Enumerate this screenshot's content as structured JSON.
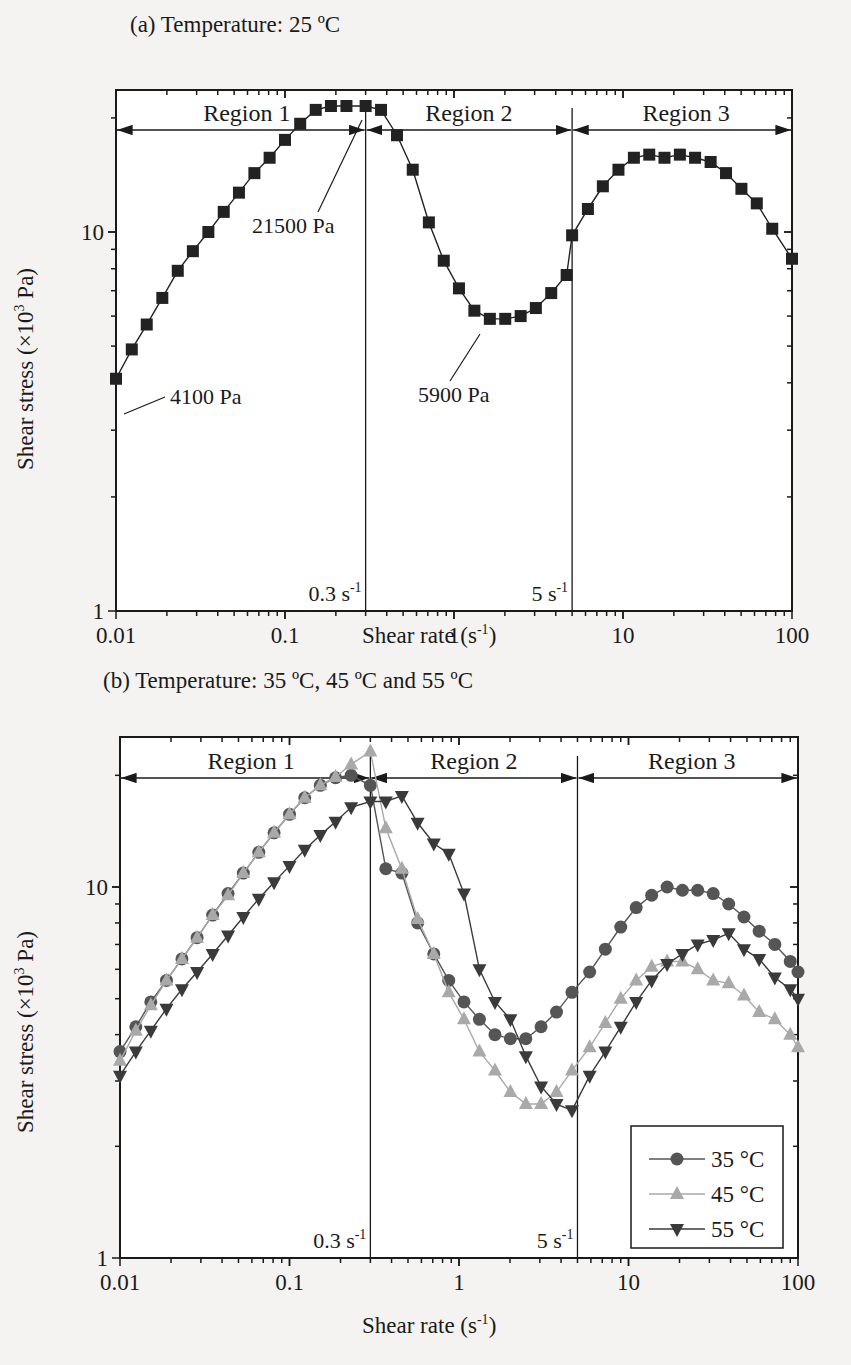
{
  "chart_data": [
    {
      "type": "line",
      "title": "(a) Temperature: 25 ºC",
      "xlabel": "Shear rate (s-1)",
      "ylabel": "Shear stress (×103 Pa)",
      "xscale": "log",
      "yscale": "log",
      "xlim": [
        0.01,
        100
      ],
      "ylim": [
        1,
        24
      ],
      "xticks": [
        "0.01",
        "0.1",
        "1",
        "10",
        "100"
      ],
      "yticks": [
        "1",
        "10"
      ],
      "grid": false,
      "regions": [
        {
          "label": "Region 1",
          "from": 0.01,
          "to": 0.3
        },
        {
          "label": "Region 2",
          "from": 0.3,
          "to": 5
        },
        {
          "label": "Region 3",
          "from": 5,
          "to": 100
        }
      ],
      "boundaries": [
        {
          "x": 0.3,
          "label": "0.3 s-1"
        },
        {
          "x": 5,
          "label": "5 s-1"
        }
      ],
      "annotations": [
        {
          "text": "4100 Pa",
          "x": 0.01,
          "y": 4.1
        },
        {
          "text": "21500 Pa",
          "x": 0.3,
          "y": 21.5
        },
        {
          "text": "5900 Pa",
          "x": 1.5,
          "y": 5.9
        }
      ],
      "series": [
        {
          "name": "25 °C",
          "marker": "square",
          "color": "#222222",
          "x": [
            0.01,
            0.0124,
            0.0152,
            0.0188,
            0.0232,
            0.0285,
            0.0352,
            0.0434,
            0.0534,
            0.0659,
            0.0811,
            0.1,
            0.123,
            0.152,
            0.187,
            0.231,
            0.3,
            0.37,
            0.46,
            0.57,
            0.71,
            0.87,
            1.07,
            1.32,
            1.63,
            2.01,
            2.48,
            3.05,
            3.76,
            4.64,
            5.0,
            6.2,
            7.6,
            9.4,
            11.6,
            14.3,
            17.6,
            21.7,
            26.7,
            33,
            40.7,
            50.2,
            61.9,
            76.4,
            100
          ],
          "y": [
            4.1,
            4.9,
            5.7,
            6.7,
            7.9,
            8.9,
            10.0,
            11.3,
            12.7,
            14.3,
            15.7,
            17.5,
            19.3,
            21.0,
            21.5,
            21.5,
            21.5,
            21.0,
            18.0,
            14.6,
            10.6,
            8.4,
            7.1,
            6.2,
            5.9,
            5.9,
            6.0,
            6.3,
            6.9,
            7.7,
            9.8,
            11.5,
            13.2,
            14.6,
            15.7,
            16.0,
            15.7,
            16.0,
            15.7,
            15.3,
            14.3,
            13.0,
            11.9,
            10.2,
            8.5
          ]
        }
      ]
    },
    {
      "type": "line",
      "title": "(b) Temperature: 35 ºC, 45 ºC and 55 ºC",
      "xlabel": "Shear rate (s-1)",
      "ylabel": "Shear stress (×103 Pa)",
      "xscale": "log",
      "yscale": "log",
      "xlim": [
        0.01,
        100
      ],
      "ylim": [
        1,
        24
      ],
      "xticks": [
        "0.01",
        "0.1",
        "1",
        "10",
        "100"
      ],
      "yticks": [
        "1",
        "10"
      ],
      "grid": false,
      "legend_position": "lower right",
      "regions": [
        {
          "label": "Region 1",
          "from": 0.01,
          "to": 0.3
        },
        {
          "label": "Region 2",
          "from": 0.3,
          "to": 5
        },
        {
          "label": "Region 3",
          "from": 5,
          "to": 100
        }
      ],
      "boundaries": [
        {
          "x": 0.3,
          "label": "0.3 s-1"
        },
        {
          "x": 5,
          "label": "5 s-1"
        }
      ],
      "series": [
        {
          "name": "35 °C",
          "marker": "circle",
          "color": "#555555",
          "x": [
            0.01,
            0.0124,
            0.0152,
            0.0188,
            0.0232,
            0.0285,
            0.0352,
            0.0434,
            0.0534,
            0.0659,
            0.0811,
            0.1,
            0.123,
            0.152,
            0.187,
            0.231,
            0.3,
            0.37,
            0.46,
            0.57,
            0.71,
            0.87,
            1.07,
            1.32,
            1.63,
            2.01,
            2.48,
            3.05,
            3.76,
            4.64,
            5.9,
            7.3,
            9.0,
            11.1,
            13.7,
            16.9,
            20.8,
            25.6,
            31.6,
            39,
            48,
            59,
            73,
            90,
            100
          ],
          "y": [
            3.6,
            4.2,
            4.9,
            5.6,
            6.4,
            7.3,
            8.4,
            9.6,
            10.9,
            12.4,
            14.0,
            15.7,
            17.4,
            18.8,
            19.7,
            20.0,
            18.8,
            11.2,
            10.9,
            8.0,
            6.6,
            5.6,
            4.9,
            4.4,
            4.0,
            3.9,
            3.9,
            4.2,
            4.6,
            5.2,
            5.9,
            6.8,
            7.8,
            8.8,
            9.5,
            10.0,
            9.8,
            9.8,
            9.6,
            9.0,
            8.3,
            7.6,
            7.0,
            6.3,
            5.9
          ]
        },
        {
          "name": "45 °C",
          "marker": "triangle-up",
          "color": "#a9a9a9",
          "x": [
            0.01,
            0.0124,
            0.0152,
            0.0188,
            0.0232,
            0.0285,
            0.0352,
            0.0434,
            0.0534,
            0.0659,
            0.0811,
            0.1,
            0.123,
            0.152,
            0.187,
            0.231,
            0.3,
            0.37,
            0.46,
            0.57,
            0.71,
            0.87,
            1.07,
            1.32,
            1.63,
            2.01,
            2.48,
            3.05,
            3.76,
            4.64,
            5.9,
            7.3,
            9.0,
            11.1,
            13.7,
            16.9,
            20.8,
            25.6,
            31.6,
            39,
            48,
            59,
            73,
            90,
            100
          ],
          "y": [
            3.4,
            4.1,
            4.8,
            5.6,
            6.4,
            7.3,
            8.4,
            9.5,
            10.9,
            12.4,
            14.0,
            15.7,
            17.4,
            18.8,
            19.8,
            21.4,
            23.2,
            14.4,
            11.2,
            8.2,
            6.6,
            5.2,
            4.4,
            3.6,
            3.2,
            2.8,
            2.6,
            2.6,
            2.8,
            3.2,
            3.7,
            4.3,
            5.0,
            5.6,
            6.1,
            6.3,
            6.3,
            6.0,
            5.6,
            5.5,
            5.1,
            4.6,
            4.4,
            4.0,
            3.7
          ]
        },
        {
          "name": "55 °C",
          "marker": "triangle-down",
          "color": "#3a3a3a",
          "x": [
            0.01,
            0.0124,
            0.0152,
            0.0188,
            0.0232,
            0.0285,
            0.0352,
            0.0434,
            0.0534,
            0.0659,
            0.0811,
            0.1,
            0.123,
            0.152,
            0.187,
            0.231,
            0.3,
            0.37,
            0.46,
            0.57,
            0.71,
            0.87,
            1.07,
            1.32,
            1.63,
            2.01,
            2.48,
            3.05,
            3.76,
            4.64,
            5.9,
            7.3,
            9.0,
            11.1,
            13.7,
            16.9,
            20.8,
            25.6,
            31.6,
            39,
            48,
            59,
            73,
            90,
            100
          ],
          "y": [
            3.1,
            3.6,
            4.1,
            4.7,
            5.3,
            5.9,
            6.6,
            7.4,
            8.3,
            9.3,
            10.3,
            11.4,
            12.6,
            13.8,
            15.0,
            16.4,
            17.0,
            17.0,
            17.6,
            14.9,
            13.1,
            12.3,
            9.6,
            6.0,
            4.9,
            4.4,
            3.5,
            2.9,
            2.6,
            2.5,
            3.1,
            3.6,
            4.2,
            4.9,
            5.6,
            6.2,
            6.6,
            7.0,
            7.2,
            7.5,
            6.8,
            6.4,
            5.7,
            5.3,
            5.0
          ]
        }
      ]
    }
  ],
  "panels": {
    "a": {
      "title": "(a) Temperature: 25 ºC",
      "region1": "Region 1",
      "region2": "Region 2",
      "region3": "Region 3",
      "boundary1": "0.3 s",
      "boundary2": "5 s",
      "sup": "-1",
      "ann_low": "4100 Pa",
      "ann_peak": "21500 Pa",
      "ann_min": "5900 Pa",
      "ylabel": "Shear stress (×10",
      "ylabel_sup": "3",
      "ylabel_end": " Pa)",
      "xlabel": "Shear rate (s",
      "xlabel_end": ")",
      "xticks": [
        "0.01",
        "0.1",
        "1",
        "10",
        "100"
      ],
      "ytick_10": "10",
      "ytick_1": "1"
    },
    "b": {
      "title": "(b) Temperature: 35 ºC, 45 ºC and 55 ºC",
      "region1": "Region 1",
      "region2": "Region 2",
      "region3": "Region 3",
      "boundary1": "0.3 s",
      "boundary2": "5 s",
      "sup": "-1",
      "ylabel": "Shear stress (×10",
      "ylabel_sup": "3",
      "ylabel_end": " Pa)",
      "xlabel": "Shear rate (s",
      "xlabel_end": ")",
      "xticks": [
        "0.01",
        "0.1",
        "1",
        "10",
        "100"
      ],
      "ytick_10": "10",
      "ytick_1": "1",
      "legend": [
        "35 °C",
        "45 °C",
        "55 °C"
      ]
    }
  }
}
